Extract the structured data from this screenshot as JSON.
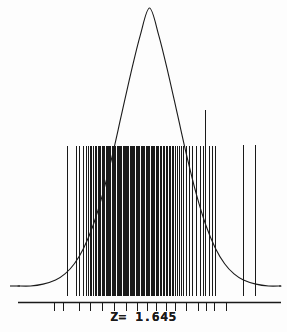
{
  "figure": {
    "width": 287,
    "height": 332,
    "background_color": "#fdfdfd",
    "ink_color": "#1a1a1a"
  },
  "annotation": {
    "z_label": "Z= 1.645",
    "z_value": 1.645
  },
  "chart_data": {
    "type": "line",
    "title": "",
    "subtitle": "",
    "xlabel": "",
    "ylabel": "",
    "grid": false,
    "legend": null,
    "annotations": [
      {
        "text": "Z= 1.645",
        "x": 1.645,
        "role": "critical-value-label",
        "position": "below-axis-center"
      }
    ],
    "axis": {
      "x_axis_line_y_px": 302,
      "x_axis_x0_px": 18,
      "x_axis_x1_px": 281,
      "baseline_y_px": 286,
      "xlim": [
        -4.2,
        4.2
      ],
      "ylim": [
        0,
        1
      ],
      "tick_positions_px": [
        54,
        63,
        79,
        90,
        102,
        114,
        126,
        137,
        147,
        156,
        166,
        175,
        186,
        198,
        206,
        214,
        226
      ]
    },
    "series": [
      {
        "name": "normal-density-curve",
        "type": "line",
        "color": "#1a1a1a",
        "x": [
          -4.2,
          -3.8,
          -3.4,
          -3.0,
          -2.7,
          -2.4,
          -2.1,
          -1.8,
          -1.5,
          -1.2,
          -0.9,
          -0.6,
          -0.3,
          0.0,
          0.3,
          0.6,
          0.9,
          1.2,
          1.5,
          1.8,
          2.1,
          2.4,
          2.7,
          3.0,
          3.4,
          3.8,
          4.2
        ],
        "y": [
          0.0,
          0.0,
          0.004,
          0.013,
          0.026,
          0.048,
          0.082,
          0.131,
          0.197,
          0.278,
          0.368,
          0.458,
          0.54,
          0.6,
          0.54,
          0.458,
          0.368,
          0.278,
          0.197,
          0.131,
          0.082,
          0.048,
          0.026,
          0.013,
          0.004,
          0.0,
          0.0
        ]
      },
      {
        "name": "sample-rug-marks",
        "type": "rug",
        "color": "#1a1a1a",
        "top_y_px": 146,
        "bottom_y_px": 296,
        "x_px": [
          67,
          76,
          79,
          83,
          86,
          88,
          90,
          91,
          93,
          95,
          96,
          98,
          99,
          100,
          102,
          103,
          104,
          106,
          107,
          108,
          109,
          110,
          112,
          113,
          114,
          115,
          117,
          118,
          119,
          120,
          121,
          123,
          124,
          125,
          126,
          127,
          128,
          130,
          131,
          132,
          133,
          134,
          136,
          137,
          138,
          139,
          141,
          142,
          143,
          144,
          146,
          147,
          148,
          149,
          151,
          152,
          153,
          154,
          156,
          157,
          158,
          160,
          161,
          163,
          164,
          166,
          167,
          169,
          170,
          172,
          173,
          175,
          177,
          179,
          181,
          183,
          186,
          189,
          192,
          196,
          200,
          203,
          209,
          212,
          215
        ]
      },
      {
        "name": "tall-rug-mark-inside",
        "type": "rug",
        "color": "#1a1a1a",
        "top_y_px": 110,
        "bottom_y_px": 296,
        "x_px": [
          205
        ]
      },
      {
        "name": "outlier-rug-marks-right",
        "type": "rug",
        "color": "#1a1a1a",
        "top_y_px": 145,
        "bottom_y_px": 296,
        "x_px": [
          243,
          255
        ]
      }
    ]
  }
}
